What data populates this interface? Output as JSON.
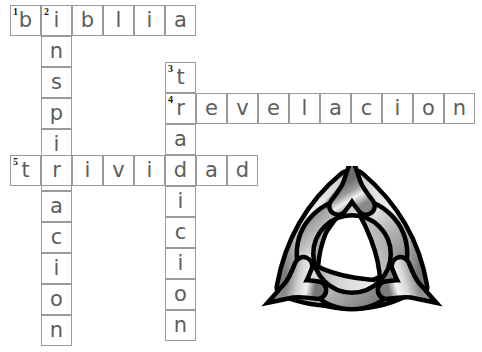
{
  "puzzle": {
    "title": "crossword-worksheet",
    "cell_size": 31,
    "grid_line_color": "#9a9a9a",
    "letter_color": "#5d5d5d",
    "background_color": "#ffffff",
    "entries": [
      {
        "number": "1",
        "direction": "across",
        "answer": "BIBLIA",
        "letters": [
          "b",
          "i",
          "b",
          "l",
          "i",
          "a"
        ],
        "start": {
          "x": 10,
          "y": 5
        }
      },
      {
        "number": "2",
        "direction": "down",
        "answer": "INSPIRACION",
        "letters": [
          "i",
          "n",
          "s",
          "p",
          "i",
          "r",
          "a",
          "c",
          "i",
          "o",
          "n"
        ],
        "start": {
          "x": 41,
          "y": 5
        }
      },
      {
        "number": "3",
        "direction": "down",
        "answer": "TRADICION",
        "letters": [
          "t",
          "r",
          "a",
          "d",
          "i",
          "c",
          "i",
          "o",
          "n"
        ],
        "start": {
          "x": 165,
          "y": 62
        }
      },
      {
        "number": "4",
        "direction": "across",
        "answer": "REVELACION",
        "letters": [
          "r",
          "e",
          "v",
          "e",
          "l",
          "a",
          "c",
          "i",
          "o",
          "n"
        ],
        "start": {
          "x": 165,
          "y": 93
        }
      },
      {
        "number": "5",
        "direction": "across",
        "answer": "TRIVIDAD",
        "letters": [
          "t",
          "r",
          "i",
          "v",
          "i",
          "d",
          "a",
          "d"
        ],
        "start": {
          "x": 10,
          "y": 155
        }
      }
    ]
  },
  "symbol": {
    "name": "triquetra-trinity-knot",
    "description": "Celtic trinity knot with interlaced circle",
    "outline_color": "#000000",
    "fill_light": "#f2f2f2",
    "fill_mid": "#a8a8a8",
    "fill_dark": "#6e6e6e",
    "position": {
      "x": 258,
      "y": 166,
      "width": 188,
      "height": 160
    }
  }
}
